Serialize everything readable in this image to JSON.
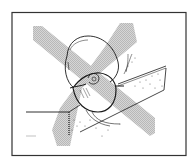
{
  "figure": {
    "crossout_mark": "X"
  },
  "colors": {
    "background": "#ffffff",
    "frame": "#333333",
    "crossout": "#c9c9c9",
    "linework": "#1a1a1a",
    "stipple": "#555555"
  }
}
